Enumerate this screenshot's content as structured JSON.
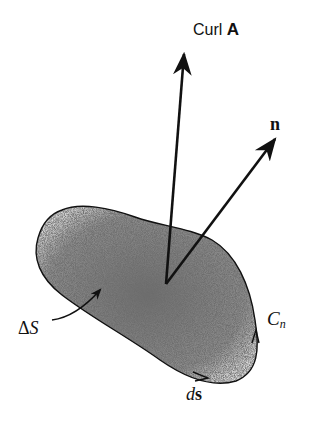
{
  "figure": {
    "labels": {
      "curl_prefix": "Curl",
      "curl_vector": "A",
      "normal": "n",
      "area_delta": "Δ",
      "area_symbol": "S",
      "contour_symbol": "C",
      "contour_subscript": "n",
      "line_element_d": "d",
      "line_element_s": "s"
    },
    "colors": {
      "ink": "#111111",
      "fill": "#8a8a8a",
      "background": "#ffffff"
    },
    "geometry": {
      "origin": [
        166,
        284
      ],
      "curl_tip": [
        184,
        52
      ],
      "normal_tip": [
        276,
        138
      ]
    }
  }
}
